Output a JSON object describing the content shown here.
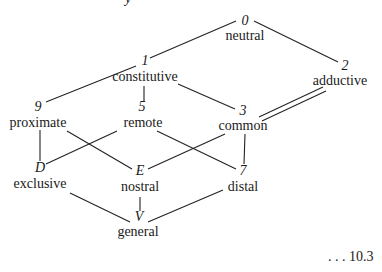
{
  "diagram": {
    "type": "lattice",
    "top_cut_text": "y",
    "nodes": {
      "n0": {
        "symbol": "0",
        "label": "neutral"
      },
      "n1": {
        "symbol": "1",
        "label": "constitutive"
      },
      "n2": {
        "symbol": "2",
        "label": "adductive"
      },
      "n9": {
        "symbol": "9",
        "label": "proximate"
      },
      "n5": {
        "symbol": "5",
        "label": "remote"
      },
      "n3": {
        "symbol": "3",
        "label": "common"
      },
      "nD": {
        "symbol": "D",
        "label": "exclusive"
      },
      "nE": {
        "symbol": "E",
        "label": "nostral"
      },
      "n7": {
        "symbol": "7",
        "label": "distal"
      },
      "nV": {
        "symbol": "V",
        "label": "general"
      }
    },
    "edges": [
      {
        "from": "0",
        "to": "1",
        "style": "single"
      },
      {
        "from": "0",
        "to": "2",
        "style": "single"
      },
      {
        "from": "1",
        "to": "9",
        "style": "single"
      },
      {
        "from": "1",
        "to": "5",
        "style": "single"
      },
      {
        "from": "1",
        "to": "3",
        "style": "single"
      },
      {
        "from": "2",
        "to": "3",
        "style": "double"
      },
      {
        "from": "9",
        "to": "D",
        "style": "single"
      },
      {
        "from": "9",
        "to": "E",
        "style": "single"
      },
      {
        "from": "5",
        "to": "D",
        "style": "single"
      },
      {
        "from": "5",
        "to": "7",
        "style": "single"
      },
      {
        "from": "3",
        "to": "E",
        "style": "single"
      },
      {
        "from": "3",
        "to": "7",
        "style": "single"
      },
      {
        "from": "D",
        "to": "V",
        "style": "single"
      },
      {
        "from": "E",
        "to": "V",
        "style": "single"
      },
      {
        "from": "7",
        "to": "V",
        "style": "single"
      }
    ],
    "equation_number": ". . . 10.3"
  }
}
